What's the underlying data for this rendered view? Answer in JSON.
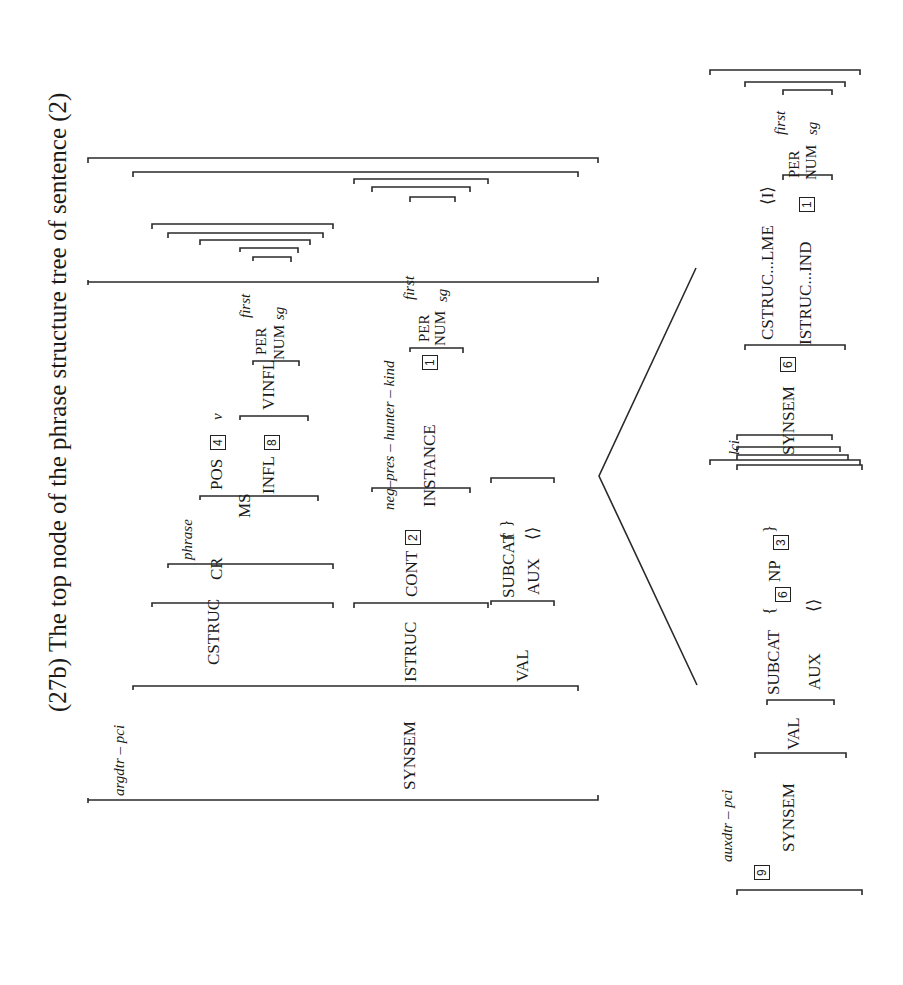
{
  "title": "(27b) The top node of the phrase structure tree of sentence (2)",
  "top_avm": {
    "type": "argdtr – pci",
    "synsem_label": "SYNSEM",
    "cstruc_label": "CSTRUC",
    "cr_label": "CR",
    "phrase_type": "phrase",
    "ms_label": "MS",
    "pos_label": "POS",
    "pos_tag": "4",
    "pos_value": "v",
    "infl_label": "INFL",
    "infl_tag": "8",
    "vinfl_label": "VINFL",
    "vinfl_per_label": "PER",
    "vinfl_per_value": "first",
    "vinfl_num_label": "NUM",
    "vinfl_num_value": "sg",
    "istruc_label": "ISTRUC",
    "cont_label": "CONT",
    "cont_tag": "2",
    "cont_type": "neg–pres – hunter – kind",
    "instance_label": "INSTANCE",
    "instance_tag": "1",
    "instance_per_label": "PER",
    "instance_per_value": "first",
    "instance_num_label": "NUM",
    "instance_num_value": "sg",
    "val_label": "VAL",
    "subcat_label": "SUBCAT",
    "subcat_value": "{ }",
    "aux_label": "AUX",
    "aux_value": "⟨⟩"
  },
  "left_daughter": {
    "tag": "9",
    "type": "auxdtr – pci",
    "synsem_label": "SYNSEM",
    "val_label": "VAL",
    "subcat_label": "SUBCAT",
    "subcat_open": "{",
    "subcat_tag": "6",
    "subcat_np": "NP",
    "subcat_np_tag": "3",
    "subcat_close": "}",
    "aux_label": "AUX",
    "aux_value": "⟨⟩"
  },
  "right_daughter": {
    "type": "lci",
    "synsem_label": "SYNSEM",
    "synsem_tag": "6",
    "cstruc_lme_label": "CSTRUC...LME",
    "cstruc_lme_value": "⟨I⟩",
    "istruc_ind_label": "ISTRUC...IND",
    "ind_tag": "1",
    "per_label": "PER",
    "per_value": "first",
    "num_label": "NUM",
    "num_value": "sg"
  }
}
